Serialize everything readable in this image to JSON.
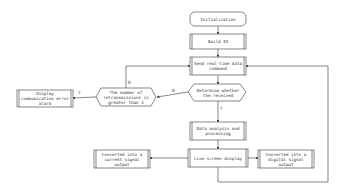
{
  "nodes": {
    "init": "Initialization",
    "build": "Build IO",
    "send": "Send real-time data command",
    "determine": "Determine whether the received",
    "retrans": "The number of retransmissions is greater than 3",
    "error": "Display communication error alarm",
    "analysis": "Data analysis and processing",
    "live": "Live screen display",
    "current": "Converted into a current signal output",
    "digital": "Converted into a digital signal output"
  },
  "labels": {
    "retrans_yes": "Y",
    "retrans_no": "N",
    "determine_no": "N",
    "determine_yes": "Y"
  },
  "colors": {
    "line": "#555555",
    "fill": "#ffffff"
  }
}
